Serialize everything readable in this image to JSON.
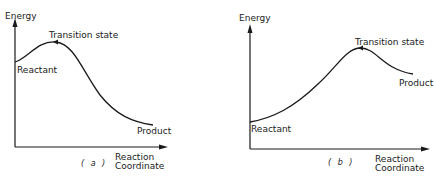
{
  "diagrams": [
    {
      "id": "a",
      "caption": "( a )",
      "y_axis_label": "Energy",
      "x_axis_label_line1": "Reaction",
      "x_axis_label_line2": "Coordinate",
      "labels": {
        "reactant": "Reactant",
        "transition_state": "Transition state",
        "product": "Product"
      },
      "description": "Exothermic reaction: reactant energy higher than product; early transition state"
    },
    {
      "id": "b",
      "caption": "( b )",
      "y_axis_label": "Energy",
      "x_axis_label_line1": "Reaction",
      "x_axis_label_line2": "Coordinate",
      "labels": {
        "reactant": "Reactant",
        "transition_state": "Transition state",
        "product": "Product"
      },
      "description": "Endothermic reaction: reactant energy lower than product; late transition state"
    }
  ],
  "colors": {
    "line": "#1a1a1a",
    "background": "#ffffff"
  }
}
